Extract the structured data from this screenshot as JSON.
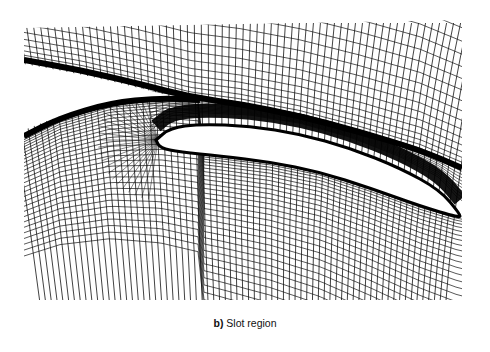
{
  "figure": {
    "caption_label": "b)",
    "caption_text": "Slot region",
    "colors": {
      "grid": "#111111",
      "background": "#ffffff",
      "dense_band": "#000000"
    },
    "mesh_bounds": {
      "left": 24,
      "top": 23,
      "right": 462,
      "bottom": 300
    },
    "elements": {
      "slat_wake_band": [
        [
          24,
          60
        ],
        [
          80,
          70
        ],
        [
          140,
          84
        ],
        [
          190,
          97
        ],
        [
          240,
          104
        ],
        [
          300,
          116
        ],
        [
          360,
          132
        ],
        [
          420,
          150
        ],
        [
          462,
          168
        ]
      ],
      "main_lower_band": [
        [
          24,
          136
        ],
        [
          60,
          118
        ],
        [
          110,
          103
        ],
        [
          160,
          98
        ],
        [
          200,
          100
        ]
      ],
      "flap_upper": [
        [
          156,
          140
        ],
        [
          170,
          128
        ],
        [
          200,
          124
        ],
        [
          250,
          126
        ],
        [
          300,
          134
        ],
        [
          350,
          148
        ],
        [
          400,
          168
        ],
        [
          440,
          190
        ],
        [
          460,
          214
        ]
      ],
      "flap_lower": [
        [
          460,
          218
        ],
        [
          420,
          206
        ],
        [
          370,
          188
        ],
        [
          320,
          172
        ],
        [
          270,
          162
        ],
        [
          220,
          156
        ],
        [
          180,
          152
        ],
        [
          160,
          148
        ],
        [
          156,
          140
        ]
      ],
      "flap_upper_band_offset": 14,
      "gap_white_upper": [
        [
          24,
          64
        ],
        [
          80,
          74
        ],
        [
          140,
          88
        ],
        [
          185,
          100
        ],
        [
          120,
          100
        ],
        [
          70,
          112
        ],
        [
          24,
          130
        ]
      ]
    },
    "grid": {
      "radial_lines": 70,
      "streamwise_lines": 40
    }
  }
}
